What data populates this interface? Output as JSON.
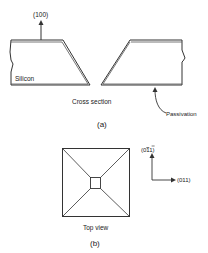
{
  "figure_a": {
    "direction_label": "(100)",
    "material_label": "Silicon",
    "caption": "Cross section",
    "passivation_label": "Passivation",
    "panel_label": "(a)"
  },
  "figure_b": {
    "caption": "Top view",
    "panel_label": "(b)",
    "axis_up_label_prefix": "(0",
    "axis_up_label_bar": "1",
    "axis_up_label_suffix": "1)",
    "axis_right_label": "(011)"
  },
  "colors": {
    "line": "#333333",
    "text": "#222222",
    "background": "#ffffff"
  }
}
